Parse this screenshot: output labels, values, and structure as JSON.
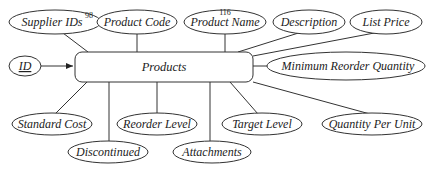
{
  "entity": {
    "label": "Products"
  },
  "key_attribute": {
    "label": "ID"
  },
  "attributes_top": [
    {
      "label": "Supplier IDs",
      "superscript": "98"
    },
    {
      "label": "Product Code"
    },
    {
      "label": "Product Name",
      "superscript": "116"
    },
    {
      "label": "Description"
    },
    {
      "label": "List Price"
    }
  ],
  "attributes_right": [
    {
      "label": "Minimum Reorder Quantity"
    }
  ],
  "attributes_bottom": [
    {
      "label": "Standard Cost"
    },
    {
      "label": "Discontinued"
    },
    {
      "label": "Reorder Level"
    },
    {
      "label": "Attachments"
    },
    {
      "label": "Target Level"
    },
    {
      "label": "Quantity Per Unit"
    }
  ],
  "colors": {
    "stroke": "#333333",
    "background": "#ffffff",
    "text": "#222222"
  }
}
